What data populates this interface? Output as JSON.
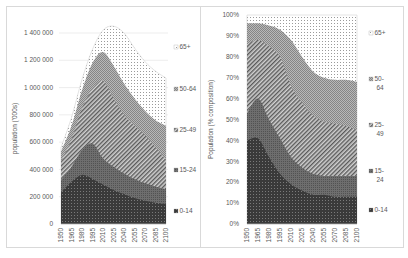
{
  "chart_data": [
    {
      "type": "area",
      "stacked": true,
      "title": "",
      "xlabel": "",
      "ylabel": "population ('000s)",
      "ylim": [
        0,
        1400000
      ],
      "yticks": [
        0,
        200000,
        400000,
        600000,
        800000,
        1000000,
        1200000,
        1400000
      ],
      "ytick_labels": [
        "0",
        "200 000",
        "400 000",
        "600 000",
        "800 000",
        "1 000 000",
        "1 200 000",
        "1 400 000"
      ],
      "grid": true,
      "legend_position": "right",
      "x": [
        1950,
        1965,
        1980,
        1995,
        2010,
        2025,
        2040,
        2055,
        2070,
        2085,
        2100
      ],
      "x_tick_labels": [
        "1950",
        "1965",
        "1980",
        "1995",
        "2010",
        "2025",
        "2040",
        "2055",
        "2070",
        "2085",
        "2100"
      ],
      "series": [
        {
          "name": "0-14",
          "pattern": "dark-dots",
          "values": [
            230000,
            310000,
            360000,
            330000,
            290000,
            250000,
            220000,
            190000,
            170000,
            155000,
            145000
          ]
        },
        {
          "name": "15-24",
          "pattern": "dark-grid",
          "values": [
            90000,
            110000,
            180000,
            260000,
            190000,
            170000,
            150000,
            140000,
            130000,
            120000,
            110000
          ]
        },
        {
          "name": "25-49",
          "pattern": "diagonal-hatch",
          "values": [
            140000,
            200000,
            310000,
            400000,
            570000,
            500000,
            430000,
            390000,
            350000,
            285000,
            215000
          ]
        },
        {
          "name": "50-64",
          "pattern": "medium-checker",
          "values": [
            70000,
            100000,
            130000,
            190000,
            210000,
            240000,
            230000,
            200000,
            180000,
            200000,
            250000
          ]
        },
        {
          "name": "65+",
          "pattern": "light-dots",
          "values": [
            30000,
            60000,
            80000,
            100000,
            160000,
            290000,
            370000,
            370000,
            360000,
            360000,
            350000
          ]
        }
      ]
    },
    {
      "type": "area",
      "stacked": true,
      "percent": true,
      "title": "",
      "xlabel": "",
      "ylabel": "Population (% composition)",
      "ylim": [
        0,
        100
      ],
      "yticks": [
        0,
        10,
        20,
        30,
        40,
        50,
        60,
        70,
        80,
        90,
        100
      ],
      "ytick_labels": [
        "0%",
        "10%",
        "20%",
        "30%",
        "40%",
        "50%",
        "60%",
        "70%",
        "80%",
        "90%",
        "100%"
      ],
      "grid": false,
      "legend_position": "right",
      "x": [
        1950,
        1965,
        1980,
        1995,
        2010,
        2025,
        2040,
        2055,
        2070,
        2085,
        2100
      ],
      "x_tick_labels": [
        "1950",
        "1965",
        "1980",
        "1995",
        "2010",
        "2025",
        "2040",
        "2055",
        "2070",
        "2085",
        "2100"
      ],
      "series": [
        {
          "name": "0-14",
          "pattern": "dark-dots",
          "values": [
            40,
            41,
            32,
            24,
            19,
            16,
            14,
            14,
            13,
            13,
            13
          ]
        },
        {
          "name": "15-24",
          "pattern": "dark-grid",
          "values": [
            13,
            19,
            18,
            17,
            13,
            11,
            10,
            9,
            10,
            10,
            10
          ]
        },
        {
          "name": "25-49",
          "pattern": "diagonal-hatch",
          "values": [
            33,
            28,
            35,
            39,
            34,
            31,
            28,
            26,
            25,
            24,
            22
          ]
        },
        {
          "name": "50-64",
          "pattern": "medium-checker",
          "values": [
            10,
            8,
            10,
            13,
            22,
            22,
            21,
            21,
            21,
            22,
            23
          ]
        },
        {
          "name": "65+",
          "pattern": "light-dots",
          "values": [
            4,
            4,
            5,
            7,
            12,
            20,
            27,
            30,
            31,
            31,
            32
          ]
        }
      ]
    }
  ],
  "left": {
    "ylabel": "population ('000s)",
    "yticks": [
      "1 400 000",
      "1 200 000",
      "1 000 000",
      "800 000",
      "600 000",
      "400 000",
      "200 000",
      "0"
    ],
    "legend": [
      "65+",
      "50-64",
      "25-49",
      "15-24",
      "0-14"
    ]
  },
  "right": {
    "ylabel": "Population (% composition)",
    "yticks": [
      "100%",
      "90%",
      "80%",
      "70%",
      "60%",
      "50%",
      "40%",
      "30%",
      "20%",
      "10%",
      "0%"
    ],
    "legend": [
      [
        "65+"
      ],
      [
        "50-",
        "64"
      ],
      [
        "25-",
        "49"
      ],
      [
        "15-",
        "24"
      ],
      [
        "0-14"
      ]
    ]
  },
  "xticks": [
    "1950",
    "1965",
    "1980",
    "1995",
    "2010",
    "2025",
    "2040",
    "2055",
    "2070",
    "2085",
    "2100"
  ],
  "colors": {
    "c0_14": "#3a3a3a",
    "c15_24": "#6e6e6e",
    "c25_49": "#8c8c8c",
    "c50_64": "#a6a6a6",
    "c65": "#e6e6e6",
    "grid": "#e0e0e0",
    "border": "#d9d9d9"
  }
}
